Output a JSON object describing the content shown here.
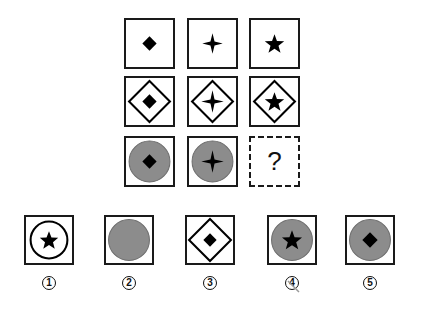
{
  "puzzle": {
    "grid": [
      [
        {
          "outer": "none",
          "inner": "diamond"
        },
        {
          "outer": "none",
          "inner": "four-point-star"
        },
        {
          "outer": "none",
          "inner": "five-point-star"
        }
      ],
      [
        {
          "outer": "diamond-outline",
          "inner": "diamond"
        },
        {
          "outer": "diamond-outline",
          "inner": "four-point-star"
        },
        {
          "outer": "diamond-outline",
          "inner": "five-point-star"
        }
      ],
      [
        {
          "outer": "gray-circle",
          "inner": "diamond"
        },
        {
          "outer": "gray-circle",
          "inner": "four-point-star"
        },
        {
          "missing": true,
          "text": "?"
        }
      ]
    ],
    "question_mark": "?",
    "options": [
      {
        "label": "1",
        "outer": "circle-outline",
        "inner": "five-point-star"
      },
      {
        "label": "2",
        "outer": "gray-circle",
        "inner": "none"
      },
      {
        "label": "3",
        "outer": "diamond-outline",
        "inner": "diamond"
      },
      {
        "label": "4",
        "outer": "gray-circle",
        "inner": "five-point-star"
      },
      {
        "label": "5",
        "outer": "gray-circle",
        "inner": "diamond"
      }
    ],
    "colors": {
      "stroke": "#1a1a1a",
      "gray_fill": "#8c8c8c",
      "gray_stroke": "#6e6e6e"
    }
  }
}
